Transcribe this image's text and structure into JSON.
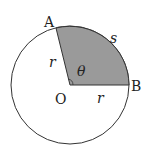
{
  "diagram": {
    "type": "circle-sector",
    "labels": {
      "point_a": "A",
      "point_b": "B",
      "center": "O",
      "radius_left": "r",
      "radius_bottom": "r",
      "arc": "s",
      "angle": "θ"
    },
    "colors": {
      "sector_fill": "#9a9a9a",
      "stroke": "#333333",
      "background": "#ffffff"
    }
  }
}
